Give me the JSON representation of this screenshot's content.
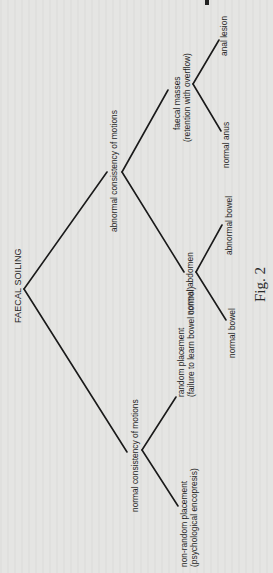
{
  "figure": {
    "caption": "Fig. 2",
    "root": "FAECAL SOILING",
    "nodes": {
      "abnormal_consistency": "abnormal consistency of motions",
      "normal_consistency": "normal consistency of motions",
      "faecal_masses_line1": "faecal masses",
      "faecal_masses_line2": "(retention with overflow)",
      "normal_abdomen": "normal abdomen",
      "anal_lesion": "anal lesion",
      "normal_anus": "normal anus",
      "abnormal_bowel": "abnormal bowel",
      "normal_bowel": "normal bowel",
      "random_placement_line1": "random placement",
      "random_placement_line2": "(failure to learn bowel control)",
      "non_random_line1": "non-random placement",
      "non_random_line2": "(psychological encopresis)"
    },
    "line_color": "#1a1a1a",
    "background_color": "#e5e5e3"
  }
}
